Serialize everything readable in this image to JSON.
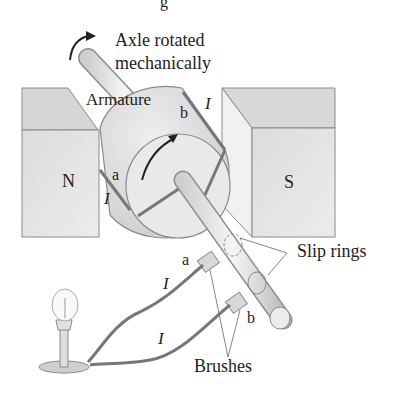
{
  "figure": {
    "title_partial": "g",
    "labels": {
      "axle": [
        "Axle rotated",
        "mechanically"
      ],
      "armature": "Armature",
      "north_pole": "N",
      "south_pole": "S",
      "slip_rings": "Slip rings",
      "brushes": "Brushes",
      "terminal_a_coil": "a",
      "terminal_b_coil": "b",
      "terminal_a_brush": "a",
      "terminal_b_brush": "b",
      "current_symbol": "I"
    },
    "colors": {
      "magnet_face": "#e6e6e6",
      "magnet_top": "#d4d4d4",
      "outline": "#7a7a7a",
      "wire": "#6e6e6e",
      "text": "#222222"
    }
  }
}
